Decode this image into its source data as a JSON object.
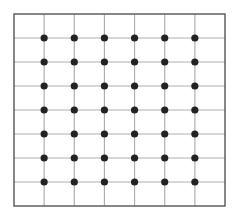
{
  "diagram": {
    "title": "",
    "grid": {
      "columns": 7,
      "rows": 8,
      "frame": {
        "left": 14,
        "top": 14,
        "right": 225,
        "bottom": 206
      },
      "dots": {
        "cols": 6,
        "rows": 7,
        "radius": 3.6
      }
    },
    "colors": {
      "background": "#ffffff",
      "frame": "#555555",
      "grid_line": "#b0b0b0",
      "dot": "#222222"
    }
  }
}
